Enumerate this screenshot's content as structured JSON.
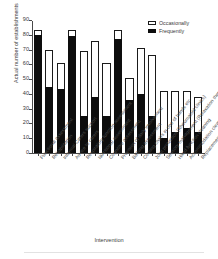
{
  "chart_data": {
    "type": "bar",
    "stacked": true,
    "title": "",
    "xlabel": "Intervention",
    "ylabel": "Actual number of establishments",
    "ylim": [
      0,
      90
    ],
    "yticks": [
      0,
      10,
      20,
      30,
      40,
      50,
      60,
      70,
      80,
      90
    ],
    "grid": false,
    "legend_position": "top-right",
    "legend": [
      "Occasionally",
      "Frequently"
    ],
    "colors": {
      "occasionally": "#ffffff",
      "frequently": "#0d0d0d",
      "outline": "#1a1a1a"
    },
    "categories": [
      "Functional assessment",
      "Rehabilitation",
      "Informal Carers support",
      "Advice to carers",
      "Respiratory function assessment",
      "Nutritional assessment",
      "Cognitive assessment",
      "Provision of daily involvement",
      "Bathing assessment",
      "Coming chairs in one of hands etc",
      "Joint protection (Rheumatoid clinics)",
      "Sensory management (Relaxation therapy)",
      "Hand function cleaning",
      "Accommodation cleaning (Group disabled)",
      "Replacement of joints (Hospital)"
    ],
    "series": [
      {
        "name": "Frequently",
        "values": [
          80,
          45,
          43,
          79,
          25,
          38,
          25,
          77,
          36,
          40,
          25,
          10,
          14,
          17,
          14
        ]
      },
      {
        "name": "Occasionally",
        "values": [
          3,
          25,
          18,
          4,
          44,
          38,
          36,
          6,
          15,
          31,
          41,
          32,
          28,
          25,
          24
        ]
      }
    ],
    "totals": [
      83,
      70,
      61,
      83,
      69,
      76,
      61,
      83,
      51,
      71,
      66,
      42,
      42,
      42,
      38
    ]
  }
}
